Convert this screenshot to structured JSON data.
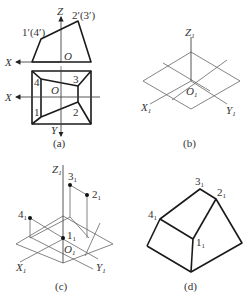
{
  "figure": {
    "panels": [
      {
        "id": "a",
        "caption": "(a)",
        "front_view": {
          "axis_labels": {
            "x": "X",
            "z": "Z",
            "origin": "O"
          },
          "vertex_labels": {
            "left_top": "1′(4′)",
            "right_top": "2′(3′)"
          }
        },
        "top_view": {
          "axis_labels": {
            "x": "X",
            "y": "Y",
            "origin": "O"
          },
          "vertex_labels": {
            "p1": "1",
            "p2": "2",
            "p3": "3",
            "p4": "4"
          }
        }
      },
      {
        "id": "b",
        "caption": "(b)",
        "axis_labels": {
          "x": "X",
          "y": "Y",
          "z": "Z",
          "origin": "O",
          "subscript": "1"
        }
      },
      {
        "id": "c",
        "caption": "(c)",
        "axis_labels": {
          "x": "X",
          "y": "Y",
          "z": "Z",
          "origin": "O",
          "subscript": "1"
        },
        "point_labels": {
          "p1": "1",
          "p2": "2",
          "p3": "3",
          "p4": "4",
          "subscript": "1"
        }
      },
      {
        "id": "d",
        "caption": "(d)",
        "point_labels": {
          "p1": "1",
          "p2": "2",
          "p3": "3",
          "p4": "4",
          "subscript": "1"
        }
      }
    ]
  }
}
